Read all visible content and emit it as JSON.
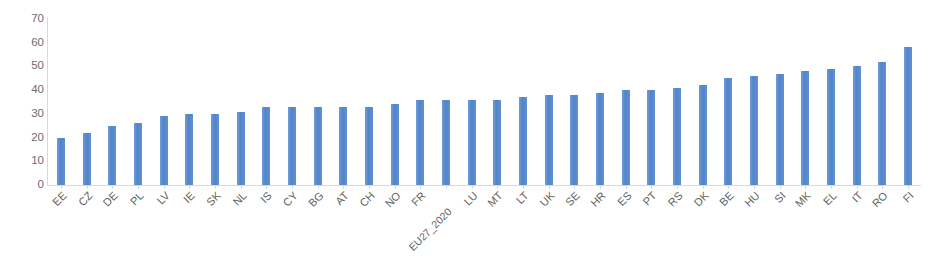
{
  "chart_data": {
    "type": "bar",
    "title": "",
    "xlabel": "",
    "ylabel": "",
    "ylim": [
      0,
      70
    ],
    "yticks": [
      0,
      10,
      20,
      30,
      40,
      50,
      60,
      70
    ],
    "grid": false,
    "legend": null,
    "legend_position": "none",
    "orientation": "vertical",
    "series_color": "#5B8ED2",
    "categories": [
      "EE",
      "CZ",
      "DE",
      "PL",
      "LV",
      "IE",
      "SK",
      "NL",
      "IS",
      "CY",
      "BG",
      "AT",
      "CH",
      "NO",
      "FR",
      "EU27_2020",
      "LU",
      "MT",
      "LT",
      "UK",
      "SE",
      "HR",
      "ES",
      "PT",
      "RS",
      "DK",
      "BE",
      "HU",
      "SI",
      "MK",
      "EL",
      "IT",
      "RO",
      "FI"
    ],
    "values": [
      20,
      22,
      25,
      26,
      29,
      30,
      30,
      31,
      33,
      33,
      33,
      33,
      33,
      34,
      36,
      36,
      36,
      36,
      37,
      38,
      38,
      39,
      40,
      40,
      41,
      42,
      45,
      46,
      47,
      48,
      49,
      50,
      52,
      58
    ]
  }
}
